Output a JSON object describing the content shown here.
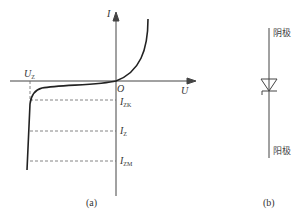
{
  "figure_a": {
    "caption": "(a)",
    "axes": {
      "x_label": "U",
      "y_label": "I",
      "origin_label": "O"
    },
    "voltage_marker": {
      "label": "U",
      "subscript": "Z"
    },
    "current_markers": [
      {
        "label": "I",
        "subscript": "ZK"
      },
      {
        "label": "I",
        "subscript": "Z"
      },
      {
        "label": "I",
        "subscript": "ZM"
      }
    ]
  },
  "figure_b": {
    "caption": "(b)",
    "top_terminal": "阴极",
    "bottom_terminal": "阳极",
    "symbol": "zener-diode"
  }
}
